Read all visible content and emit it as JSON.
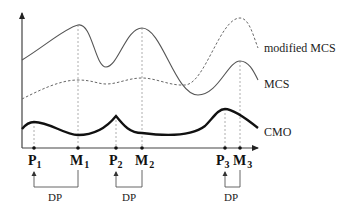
{
  "diagram": {
    "curves": [
      {
        "id": "modified-mcs",
        "label": "modified MCS",
        "style": "dashed-thin"
      },
      {
        "id": "mcs",
        "label": "MCS",
        "style": "solid-thin"
      },
      {
        "id": "cmo",
        "label": "CMO",
        "style": "solid-thick"
      }
    ],
    "points": [
      {
        "id": "p1",
        "base": "P",
        "sub": "1"
      },
      {
        "id": "m1",
        "base": "M",
        "sub": "1"
      },
      {
        "id": "p2",
        "base": "P",
        "sub": "2"
      },
      {
        "id": "m2",
        "base": "M",
        "sub": "2"
      },
      {
        "id": "p3",
        "base": "P",
        "sub": "3"
      },
      {
        "id": "m3",
        "base": "M",
        "sub": "3"
      }
    ],
    "brackets": [
      {
        "label": "DP",
        "from": "M1",
        "to": "P1"
      },
      {
        "label": "DP",
        "from": "M2",
        "to": "P2"
      },
      {
        "label": "DP",
        "from": "M3",
        "to": "P3"
      }
    ],
    "colors": {
      "axis": "#444444",
      "curve": "#555555",
      "cmo": "#111111",
      "guide": "#9a9a9a"
    }
  }
}
